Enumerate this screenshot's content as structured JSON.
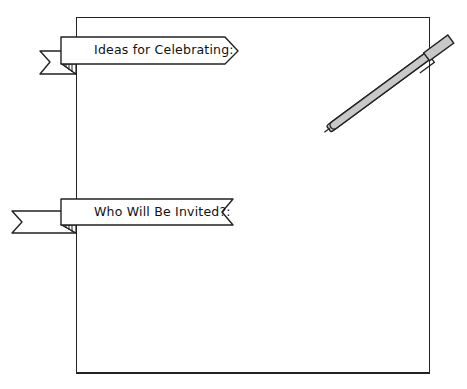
{
  "worksheet": {
    "sections": [
      {
        "id": "ideas",
        "heading": "Ideas for Celebrating:",
        "ribbon_end": "arrow"
      },
      {
        "id": "invitees",
        "heading": "Who Will Be Invited?:",
        "ribbon_end": "notch"
      }
    ],
    "decorations": {
      "pen": {
        "icon": "pen-icon",
        "body_color": "#c8c8c8",
        "outline_color": "#222222"
      }
    },
    "colors": {
      "ink": "#222222",
      "paper": "#ffffff",
      "ribbon_fill": "#ffffff"
    }
  }
}
